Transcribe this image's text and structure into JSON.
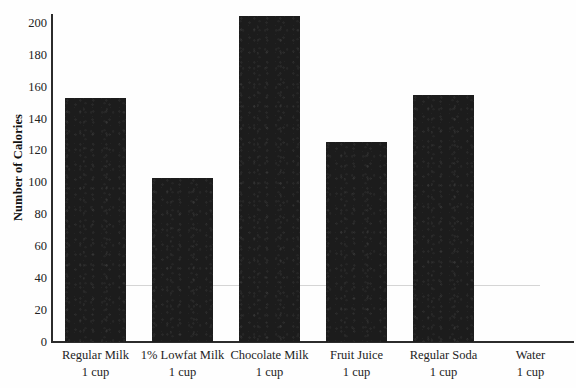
{
  "chart_data": {
    "type": "bar",
    "title": "",
    "xlabel": "",
    "ylabel": "Number of Calories",
    "ylim": [
      0,
      208
    ],
    "yticks": [
      0,
      20,
      40,
      60,
      80,
      100,
      120,
      140,
      160,
      180,
      200
    ],
    "ytick_labels": [
      "0",
      "20",
      "40",
      "60",
      "80",
      "100",
      "120",
      "140",
      "160",
      "180",
      "200"
    ],
    "grid": false,
    "legend": null,
    "categories": [
      "Regular Milk",
      "1% Lowfat Milk",
      "Chocolate Milk",
      "Fruit Juice",
      "Regular Soda",
      "Water"
    ],
    "category_units": [
      "1 cup",
      "1 cup",
      "1 cup",
      "1 cup",
      "1 cup",
      "1 cup"
    ],
    "values": [
      153,
      103,
      204,
      125,
      155,
      0
    ],
    "bar_color": "#1c1c1c"
  },
  "axis": {
    "y_title": "Number of Calories"
  },
  "ticks": [
    {
      "label": "200"
    },
    {
      "label": "180"
    },
    {
      "label": "160"
    },
    {
      "label": "140"
    },
    {
      "label": "120"
    },
    {
      "label": "100"
    },
    {
      "label": "80"
    },
    {
      "label": "60"
    },
    {
      "label": "40"
    },
    {
      "label": "20"
    },
    {
      "label": "0"
    }
  ],
  "bars": [
    {
      "name": "Regular Milk",
      "unit": "1 cup",
      "value": 153
    },
    {
      "name": "1% Lowfat Milk",
      "unit": "1 cup",
      "value": 103
    },
    {
      "name": "Chocolate Milk",
      "unit": "1 cup",
      "value": 204
    },
    {
      "name": "Fruit Juice",
      "unit": "1 cup",
      "value": 125
    },
    {
      "name": "Regular Soda",
      "unit": "1 cup",
      "value": 155
    },
    {
      "name": "Water",
      "unit": "1 cup",
      "value": 0
    }
  ],
  "title": {
    "text": ""
  }
}
